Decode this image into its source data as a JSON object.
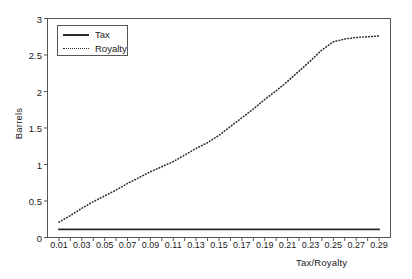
{
  "chart_data": {
    "type": "line",
    "title": "",
    "xlabel": "Tax/Royalty",
    "ylabel": "Barrels",
    "xlim": [
      0.0,
      0.3
    ],
    "ylim": [
      0,
      3
    ],
    "grid": false,
    "legend_position": "top-left",
    "ytick_labels": [
      "0",
      "0.5",
      "1",
      "1.5",
      "2",
      "2.5",
      "3"
    ],
    "ytick_values": [
      0,
      0.5,
      1,
      1.5,
      2,
      2.5,
      3
    ],
    "xtick_labels": [
      "0.01",
      "0.03",
      "0.05",
      "0.07",
      "0.09",
      "0.11",
      "0.13",
      "0.15",
      "0.17",
      "0.19",
      "0.21",
      "0.23",
      "0.25",
      "0.27",
      "0.29"
    ],
    "xtick_values": [
      0.01,
      0.03,
      0.05,
      0.07,
      0.09,
      0.11,
      0.13,
      0.15,
      0.17,
      0.19,
      0.21,
      0.23,
      0.25,
      0.27,
      0.29
    ],
    "x": [
      0.01,
      0.02,
      0.03,
      0.04,
      0.05,
      0.06,
      0.07,
      0.08,
      0.09,
      0.1,
      0.11,
      0.12,
      0.13,
      0.14,
      0.15,
      0.16,
      0.17,
      0.18,
      0.19,
      0.2,
      0.21,
      0.22,
      0.23,
      0.24,
      0.25,
      0.26,
      0.27,
      0.28,
      0.29
    ],
    "series": [
      {
        "name": "Tax",
        "style": "solid",
        "color": "#2b2b2b",
        "values": [
          0.11,
          0.11,
          0.11,
          0.11,
          0.11,
          0.11,
          0.11,
          0.11,
          0.11,
          0.11,
          0.11,
          0.11,
          0.11,
          0.11,
          0.11,
          0.11,
          0.11,
          0.11,
          0.11,
          0.11,
          0.11,
          0.11,
          0.11,
          0.11,
          0.11,
          0.11,
          0.11,
          0.11,
          0.11
        ]
      },
      {
        "name": "Royalty",
        "style": "dotted",
        "color": "#2b2b2b",
        "values": [
          0.21,
          0.3,
          0.4,
          0.49,
          0.57,
          0.65,
          0.74,
          0.82,
          0.9,
          0.97,
          1.04,
          1.13,
          1.22,
          1.3,
          1.4,
          1.52,
          1.64,
          1.76,
          1.89,
          2.01,
          2.14,
          2.28,
          2.42,
          2.57,
          2.68,
          2.72,
          2.74,
          2.75,
          2.76
        ]
      }
    ]
  },
  "legend": {
    "entries": [
      {
        "label": "Tax"
      },
      {
        "label": "Royalty"
      }
    ]
  }
}
